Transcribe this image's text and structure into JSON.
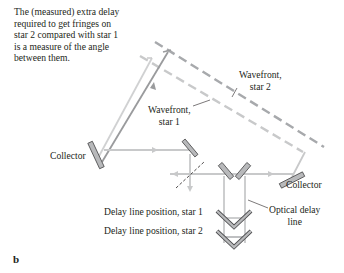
{
  "caption": {
    "lines": [
      "The (measured) extra delay",
      "required to get fringes on",
      "star 2 compared with star 1",
      "is a measure of the angle",
      "between them."
    ]
  },
  "labels": {
    "wavefront_star2": [
      "Wavefront,",
      "star 2"
    ],
    "wavefront_star1": [
      "Wavefront,",
      "star 1"
    ],
    "collector_left": "Collector",
    "collector_right": "Collector",
    "optical_delay_line": [
      "Optical delay",
      "line"
    ],
    "delay_pos_star1": "Delay line position, star 1",
    "delay_pos_star2": "Delay line position, star 2",
    "panel_letter": "b"
  },
  "colors": {
    "beam": "#c8c9ca",
    "beam_dark": "#9a9b9d",
    "wavefront_dash": "#a7a9ac",
    "mirror_fill": "#b8b9bb",
    "mirror_stroke": "#4d4d4f",
    "text": "#231f20"
  }
}
